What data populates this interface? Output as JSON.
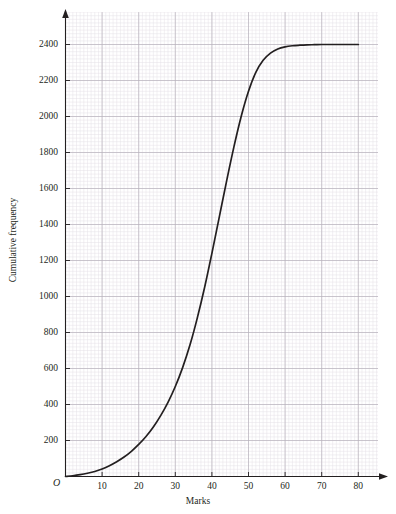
{
  "chart_data": {
    "type": "line",
    "title": "",
    "subtitle": "",
    "xlabel": "Marks",
    "ylabel": "Cumulative frequency",
    "origin_label": "O",
    "xlim": [
      0,
      88
    ],
    "ylim": [
      0,
      2580
    ],
    "xticks": [
      10,
      20,
      30,
      40,
      50,
      60,
      70,
      80
    ],
    "xtick_labels": [
      "10",
      "20",
      "30",
      "40",
      "50",
      "60",
      "70",
      "80"
    ],
    "yticks": [
      200,
      400,
      600,
      800,
      1000,
      1200,
      1400,
      1600,
      1800,
      2000,
      2200,
      2400
    ],
    "ytick_labels": [
      "200",
      "400",
      "600",
      "800",
      "1000",
      "1200",
      "1400",
      "1600",
      "1800",
      "2000",
      "2200",
      "2400"
    ],
    "grid": true,
    "grid_major_step_x": 10,
    "grid_major_step_y": 200,
    "grid_minor_per_major": 10,
    "legend": null,
    "legend_position": "none",
    "series": [
      {
        "name": "Cumulative frequency",
        "x": [
          0,
          2,
          4,
          6,
          8,
          10,
          12,
          14,
          16,
          18,
          20,
          22,
          24,
          26,
          28,
          30,
          32,
          34,
          36,
          38,
          40,
          42,
          44,
          46,
          48,
          50,
          52,
          54,
          56,
          58,
          60,
          62,
          64,
          66,
          68,
          70,
          72,
          74,
          76,
          78,
          80
        ],
        "y": [
          0,
          4,
          10,
          18,
          28,
          42,
          60,
          82,
          108,
          140,
          178,
          222,
          275,
          338,
          412,
          500,
          605,
          730,
          880,
          1050,
          1240,
          1440,
          1640,
          1830,
          2000,
          2140,
          2245,
          2312,
          2352,
          2375,
          2387,
          2393,
          2396,
          2398,
          2399,
          2400,
          2400,
          2400,
          2400,
          2400,
          2400
        ]
      }
    ],
    "colors": {
      "curve": "#231f20",
      "axis": "#231f20",
      "grid_major": "#b9b4bd",
      "grid_minor": "#e2dfe4",
      "text": "#231f20",
      "background": "#ffffff"
    }
  },
  "axes": {
    "x_title": "Marks",
    "y_title": "Cumulative frequency",
    "origin": "O"
  }
}
